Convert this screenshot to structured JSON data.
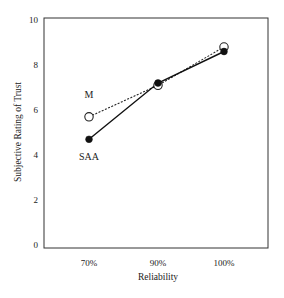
{
  "chart_data": {
    "type": "line",
    "title": "",
    "xlabel": "Reliability",
    "ylabel": "Subjective Rating of Trust",
    "categories": [
      "70%",
      "90%",
      "100%"
    ],
    "ylim": [
      0,
      10
    ],
    "yticks": [
      0,
      2,
      4,
      6,
      8,
      10
    ],
    "grid": false,
    "legend": "inline labels near 70% points",
    "series": [
      {
        "name": "M",
        "values": [
          5.7,
          7.1,
          8.8
        ],
        "line_style": "dashed",
        "marker": "open-circle",
        "color": "#222222"
      },
      {
        "name": "SAA",
        "values": [
          4.7,
          7.2,
          8.6
        ],
        "line_style": "solid",
        "marker": "filled-circle",
        "color": "#111111"
      }
    ]
  },
  "axes": {
    "x_title": "Reliability",
    "y_title": "Subjective Rating of Trust",
    "x_ticks": [
      "70%",
      "90%",
      "100%"
    ],
    "y_ticks": [
      "0",
      "2",
      "4",
      "6",
      "8",
      "10"
    ]
  },
  "labels": {
    "m": "M",
    "saa": "SAA"
  }
}
